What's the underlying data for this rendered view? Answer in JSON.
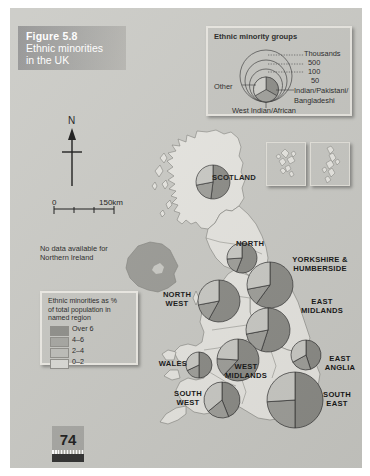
{
  "figure": {
    "number_label": "Figure 5.8",
    "title_line1": "Ethnic minorities",
    "title_line2": "in the UK",
    "page_number": "74"
  },
  "map": {
    "north_label": "N",
    "scale_zero": "0",
    "scale_max": "150km",
    "no_data_note_line1": "No data available for",
    "no_data_note_line2": "Northern Ireland"
  },
  "key_groups": {
    "title": "Ethnic minority groups",
    "size_units": "Thousands",
    "size_ticks": [
      "500",
      "100",
      "50"
    ],
    "slice_other": "Other",
    "slice_indian_line1": "Indian/Pakistani/",
    "slice_indian_line2": "Bangladeshi",
    "slice_west_indian": "West Indian/African"
  },
  "key_percent": {
    "title_line1": "Ethnic minorities as %",
    "title_line2": "of total population in",
    "title_line3": "named region",
    "classes": [
      {
        "label": "Over 6",
        "color": "#8d8d88"
      },
      {
        "label": "4–6",
        "color": "#a5a5a0"
      },
      {
        "label": "2–4",
        "color": "#bdbdb8"
      },
      {
        "label": "0–2",
        "color": "#d9d9d4"
      }
    ]
  },
  "regions": [
    {
      "name": "SCOTLAND",
      "label": "SCOTLAND",
      "cx": 203,
      "cy": 174,
      "r": 17,
      "class_color": "#d9d9d4",
      "slices": [
        52,
        20,
        28
      ],
      "lx": 224,
      "ly": 170
    },
    {
      "name": "NORTH",
      "label": "NORTH",
      "cx": 232,
      "cy": 250,
      "r": 15,
      "class_color": "#d9d9d4",
      "slices": [
        56,
        18,
        26
      ],
      "lx": 240,
      "ly": 236
    },
    {
      "name": "YORKSHIRE & HUMBERSIDE",
      "label": "YORKSHIRE &\nHUMBERSIDE",
      "cx": 260,
      "cy": 277,
      "r": 23,
      "class_color": "#a5a5a0",
      "slices": [
        60,
        12,
        28
      ],
      "lx": 310,
      "ly": 257
    },
    {
      "name": "NORTH WEST",
      "label": "NORTH\nWEST",
      "cx": 209,
      "cy": 293,
      "r": 21,
      "class_color": "#a5a5a0",
      "slices": [
        58,
        14,
        28
      ],
      "lx": 167,
      "ly": 292
    },
    {
      "name": "EAST MIDLANDS",
      "label": "EAST\nMIDLANDS",
      "cx": 258,
      "cy": 322,
      "r": 22,
      "class_color": "#bdbdb8",
      "slices": [
        55,
        17,
        28
      ],
      "lx": 312,
      "ly": 299
    },
    {
      "name": "WEST MIDLANDS",
      "label": "WEST\nMIDLANDS",
      "cx": 228,
      "cy": 352,
      "r": 21,
      "class_color": "#8d8d88",
      "slices": [
        62,
        14,
        24
      ],
      "lx": 236,
      "ly": 364
    },
    {
      "name": "EAST ANGLIA",
      "label": "EAST\nANGLIA",
      "cx": 296,
      "cy": 347,
      "r": 15,
      "class_color": "#d9d9d4",
      "slices": [
        45,
        22,
        33
      ],
      "lx": 330,
      "ly": 356
    },
    {
      "name": "WALES",
      "label": "WALES",
      "cx": 189,
      "cy": 357,
      "r": 13,
      "class_color": "#d9d9d4",
      "slices": [
        50,
        18,
        32
      ],
      "lx": 163,
      "ly": 356
    },
    {
      "name": "SOUTH EAST",
      "label": "SOUTH\nEAST",
      "cx": 285,
      "cy": 392,
      "r": 28,
      "class_color": "#a5a5a0",
      "slices": [
        50,
        24,
        26
      ],
      "lx": 327,
      "ly": 392
    },
    {
      "name": "SOUTH WEST",
      "label": "SOUTH\nWEST",
      "cx": 212,
      "cy": 392,
      "r": 18,
      "class_color": "#d9d9d4",
      "slices": [
        44,
        20,
        36
      ],
      "lx": 178,
      "ly": 391
    }
  ],
  "colors": {
    "slice_indian_pakistani_bangladeshi": "#8a8a85",
    "slice_west_indian_african": "#9e9e99",
    "slice_other": "#c9c9c4",
    "background": "#c9c9c4",
    "land_light": "#e6e5e0",
    "northern_ireland": "#9a9a95",
    "title_block": "#9a9a9a"
  }
}
